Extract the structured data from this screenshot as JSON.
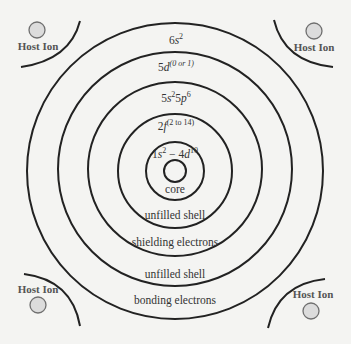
{
  "diagram": {
    "center": {
      "x": 175,
      "y": 171
    },
    "rings": [
      {
        "name": "core",
        "radius": 11
      },
      {
        "name": "1s-4d",
        "radius": 29
      },
      {
        "name": "2f",
        "radius": 57
      },
      {
        "name": "5s5p",
        "radius": 87
      },
      {
        "name": "5d",
        "radius": 117
      },
      {
        "name": "6s",
        "radius": 148
      }
    ],
    "shell_labels": {
      "s6": {
        "base": "6",
        "orb": "s",
        "sup": "2"
      },
      "d5": {
        "base": "5",
        "orb": "d",
        "sup": "(0 or 1)"
      },
      "sp5": {
        "base1": "5",
        "orb1": "s",
        "sup1": "2",
        "base2": "5",
        "orb2": "p",
        "sup2": "6"
      },
      "f2": {
        "base": "2",
        "orb": "f",
        "sup": "(2 to 14)"
      },
      "core_shells": {
        "base1": "1",
        "orb1": "s",
        "sup1": "2",
        "sep": " − 4",
        "orb2": "d",
        "sup2": "10"
      }
    },
    "region_labels": {
      "core": "core",
      "unfilled_shell_inner": "unfilled shell",
      "shielding": "shielding electrons",
      "unfilled_shell_outer": "unfilled shell",
      "bonding": "bonding electrons"
    },
    "host_ions": [
      {
        "position": "top-left",
        "label": "Host Ion"
      },
      {
        "position": "top-right",
        "label": "Host Ion"
      },
      {
        "position": "bottom-left",
        "label": "Host Ion"
      },
      {
        "position": "bottom-right",
        "label": "Host Ion"
      }
    ],
    "colors": {
      "background": "#f4f4f2",
      "ring_stroke": "#222222",
      "ion_fill": "#dcdcdc",
      "ion_stroke": "#6f6f6f",
      "label_text": "#333333",
      "host_text": "#555555"
    }
  }
}
